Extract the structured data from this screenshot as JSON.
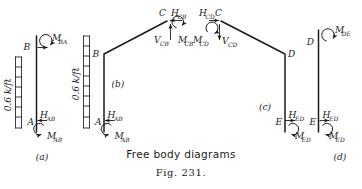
{
  "figure": {
    "caption": "Free body diagrams",
    "fig_number": "Fig. 231.",
    "ink_color": "#1a1a1a",
    "background_color": "#ffffff"
  },
  "panels": [
    {
      "id": "a",
      "label": "(a)",
      "description": "Free body diagram of column AB",
      "joints": [
        "B",
        "A"
      ],
      "load_label": "0.6 k/ft",
      "forces": [
        "H_AB"
      ],
      "moments": [
        "M_BA",
        "M_AB"
      ]
    },
    {
      "id": "b",
      "label": "(b)",
      "description": "Free body diagram of member ABC",
      "joints": [
        "C",
        "B",
        "A"
      ],
      "load_label": "0.6 k/ft",
      "forces": [
        "H_CB",
        "V_CB",
        "H_AB"
      ],
      "moments": [
        "M_CB",
        "M_AB"
      ]
    },
    {
      "id": "c",
      "label": "(c)",
      "description": "Free body diagram of member CDE",
      "joints": [
        "C",
        "D",
        "E"
      ],
      "forces": [
        "H_CD",
        "V_CD",
        "H_ED"
      ],
      "moments": [
        "M_CD",
        "M_ED"
      ]
    },
    {
      "id": "d",
      "label": "(d)",
      "description": "Free body diagram of column DE",
      "joints": [
        "D",
        "E"
      ],
      "forces": [
        "H_ED"
      ],
      "moments": [
        "M_DE",
        "M_ED"
      ]
    }
  ],
  "labels": {
    "panel_a": "(a)",
    "panel_b": "(b)",
    "panel_c": "(c)",
    "panel_d": "(d)",
    "joint_B_a": "B",
    "joint_A_a": "A",
    "joint_B_b": "B",
    "joint_A_b": "A",
    "joint_C_b": "C",
    "joint_C_c": "C",
    "joint_D_c": "D",
    "joint_E_c": "E",
    "joint_D_d": "D",
    "joint_E_d": "E",
    "load_left": "0.6 k/ft",
    "load_right": "0.6 k/ft",
    "M_BA": "M",
    "M_BA_sub": "BA",
    "H_AB_a": "H",
    "H_AB_a_sub": "AB",
    "M_AB_a": "M",
    "M_AB_a_sub": "AB",
    "H_CB": "H",
    "H_CB_sub": "CB",
    "V_CB": "V",
    "V_CB_sub": "CB",
    "M_CB": "M",
    "M_CB_sub": "CB",
    "H_AB_b": "H",
    "H_AB_b_sub": "AB",
    "M_AB_b": "M",
    "M_AB_b_sub": "AB",
    "H_CD": "H",
    "H_CD_sub": "CD",
    "V_CD": "V",
    "V_CD_sub": "CD",
    "M_CD": "M",
    "M_CD_sub": "CD",
    "H_ED_c": "H",
    "H_ED_c_sub": "ED",
    "M_ED_c": "M",
    "M_ED_c_sub": "ED",
    "M_DE": "M",
    "M_DE_sub": "DE",
    "H_ED_d": "H",
    "H_ED_d_sub": "ED",
    "M_ED_d": "M",
    "M_ED_d_sub": "ED"
  }
}
